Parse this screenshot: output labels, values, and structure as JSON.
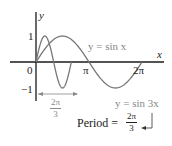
{
  "chart_data": {
    "type": "line",
    "title": "",
    "xlabel": "x",
    "ylabel": "y",
    "x_ticks": [
      "0",
      "π",
      "2π"
    ],
    "y_ticks": [
      "1",
      "-1"
    ],
    "xlim": [
      -0.5,
      2.3
    ],
    "ylim": [
      -1,
      1
    ],
    "series": [
      {
        "name": "y = sin x",
        "function": "sin(x)",
        "domain": [
          0,
          6.2832
        ],
        "period": "2π",
        "color": "#777777"
      },
      {
        "name": "y = sin 3x",
        "function": "sin(3x)",
        "domain": [
          0,
          2.0944
        ],
        "period": "2π/3",
        "color": "#777777"
      }
    ],
    "annotations": [
      {
        "text": "2π/3",
        "type": "double-arrow",
        "from": 0,
        "to": 2.0944
      },
      {
        "text": "Period = 2π/3",
        "type": "callout",
        "target": "y = sin 3x"
      }
    ]
  },
  "labels": {
    "y_axis": "y",
    "x_axis": "x",
    "origin": "0",
    "one": "1",
    "neg_one": "−1",
    "pi": "π",
    "two_pi": "2π",
    "sinx_label": "y = sin x",
    "sin3x_label": "y = sin 3x",
    "span_num": "2π",
    "span_den": "3",
    "period_text": "Period =",
    "period_num": "2π",
    "period_den": "3"
  },
  "colors": {
    "axis": "#1a1a1a",
    "curve": "#777777",
    "annotation": "#888888"
  }
}
